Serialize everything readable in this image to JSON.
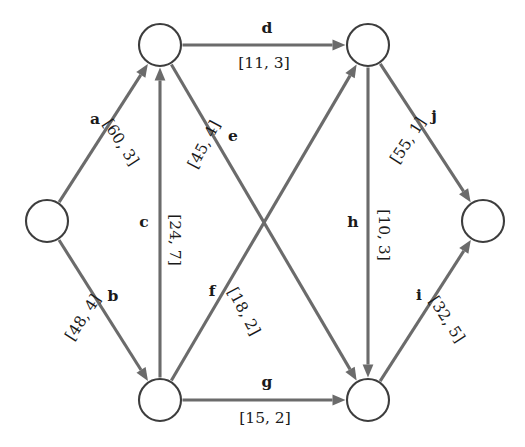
{
  "diagram": {
    "type": "directed-network-graph",
    "title": "",
    "background_color": "#ffffff",
    "node_stroke_color": "#3d3d3d",
    "node_fill_color": "#ffffff",
    "edge_color": "#6b6b6b",
    "label_color": "#1a1a1a",
    "node_radius": 21,
    "nodes": [
      {
        "id": "n1",
        "name": "left-node",
        "x": 47,
        "y": 221,
        "label": ""
      },
      {
        "id": "n2",
        "name": "top-left-node",
        "x": 160,
        "y": 45,
        "label": ""
      },
      {
        "id": "n3",
        "name": "bottom-left-node",
        "x": 160,
        "y": 400,
        "label": ""
      },
      {
        "id": "n4",
        "name": "top-right-node",
        "x": 368,
        "y": 45,
        "label": ""
      },
      {
        "id": "n5",
        "name": "bottom-right-node",
        "x": 368,
        "y": 400,
        "label": ""
      },
      {
        "id": "n6",
        "name": "right-node",
        "x": 483,
        "y": 221,
        "label": ""
      }
    ],
    "edges": [
      {
        "id": "a",
        "label": "a",
        "capacity_label": "[60, 3]",
        "cost": 60,
        "weight": 3,
        "from": "n1",
        "to": "n2",
        "id_pos": {
          "x": 95,
          "y": 120
        },
        "cap_pos": {
          "x": 120,
          "y": 143
        },
        "cap_rot": -57
      },
      {
        "id": "b",
        "label": "b",
        "capacity_label": "[48, 4]",
        "cost": 48,
        "weight": 4,
        "from": "n1",
        "to": "n3",
        "id_pos": {
          "x": 113,
          "y": 297
        },
        "cap_pos": {
          "x": 84,
          "y": 318
        },
        "cap_rot": 57
      },
      {
        "id": "c",
        "label": "c",
        "capacity_label": "[24, 7]",
        "cost": 24,
        "weight": 7,
        "from": "n3",
        "to": "n2",
        "id_pos": {
          "x": 144,
          "y": 223
        },
        "cap_pos": {
          "x": 174,
          "y": 240
        },
        "cap_rot": -90
      },
      {
        "id": "d",
        "label": "d",
        "capacity_label": "[11, 3]",
        "cost": 11,
        "weight": 3,
        "from": "n2",
        "to": "n4",
        "id_pos": {
          "x": 267,
          "y": 29
        },
        "cap_pos": {
          "x": 264,
          "y": 64
        },
        "cap_rot": 0
      },
      {
        "id": "e",
        "label": "e",
        "capacity_label": "[45, 4]",
        "cost": 45,
        "weight": 4,
        "from": "n2",
        "to": "n5",
        "id_pos": {
          "x": 233,
          "y": 137
        },
        "cap_pos": {
          "x": 205,
          "y": 145
        },
        "cap_rot": 62
      },
      {
        "id": "f",
        "label": "f",
        "capacity_label": "[18, 2]",
        "cost": 18,
        "weight": 2,
        "from": "n3",
        "to": "n4",
        "id_pos": {
          "x": 212,
          "y": 292
        },
        "cap_pos": {
          "x": 243,
          "y": 312
        },
        "cap_rot": -62
      },
      {
        "id": "g",
        "label": "g",
        "capacity_label": "[15, 2]",
        "cost": 15,
        "weight": 2,
        "from": "n3",
        "to": "n5",
        "id_pos": {
          "x": 267,
          "y": 383
        },
        "cap_pos": {
          "x": 265,
          "y": 419
        },
        "cap_rot": 0
      },
      {
        "id": "h",
        "label": "h",
        "capacity_label": "[10, 3]",
        "cost": 10,
        "weight": 3,
        "from": "n4",
        "to": "n5",
        "id_pos": {
          "x": 353,
          "y": 223
        },
        "cap_pos": {
          "x": 383,
          "y": 235
        },
        "cap_rot": -90
      },
      {
        "id": "i",
        "label": "i",
        "capacity_label": "[32, 5]",
        "cost": 32,
        "weight": 5,
        "from": "n5",
        "to": "n6",
        "id_pos": {
          "x": 419,
          "y": 296
        },
        "cap_pos": {
          "x": 446,
          "y": 320
        },
        "cap_rot": -57
      },
      {
        "id": "j",
        "label": "j",
        "capacity_label": "[55, 1]",
        "cost": 55,
        "weight": 1,
        "from": "n4",
        "to": "n6",
        "id_pos": {
          "x": 434,
          "y": 117
        },
        "cap_pos": {
          "x": 409,
          "y": 141
        },
        "cap_rot": 57
      }
    ]
  }
}
